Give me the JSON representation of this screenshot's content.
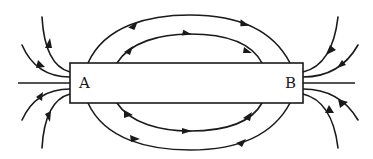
{
  "diagram": {
    "type": "bar-magnet-field-lines",
    "magnet": {
      "left_label": "A",
      "right_label": "B"
    },
    "colors": {
      "line": "#1a1a1a",
      "background": "#ffffff"
    }
  }
}
